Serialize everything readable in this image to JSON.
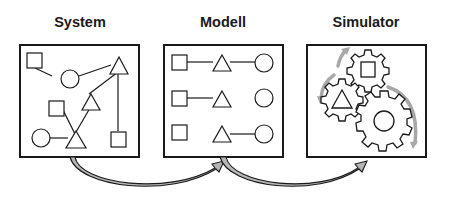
{
  "diagram": {
    "panels": [
      {
        "id": "system",
        "title": "System",
        "description": "unstructured set of squares, circles and triangles connected by lines"
      },
      {
        "id": "modell",
        "title": "Modell",
        "description": "three structured rows: square - triangle - circle"
      },
      {
        "id": "simulator",
        "title": "Simulator",
        "description": "three interlocking gears containing square, triangle and circle with rotation arrows"
      }
    ],
    "arrows": [
      {
        "from": "System",
        "to": "Modell"
      },
      {
        "from": "Modell",
        "to": "Simulator"
      }
    ],
    "colors": {
      "stroke": "#1a1a1a",
      "arrow_fill": "#b5b5b5",
      "rotation_arrows": "#a8a8a8",
      "background": "#ffffff"
    }
  }
}
